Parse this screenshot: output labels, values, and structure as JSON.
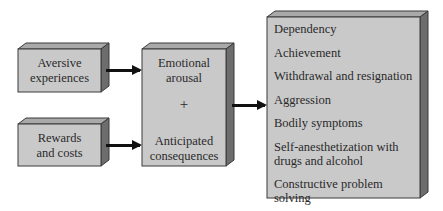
{
  "diagram": {
    "inputs": [
      {
        "label": "Aversive experiences",
        "line1": "Aversive",
        "line2": "experiences"
      },
      {
        "label": "Rewards and costs",
        "line1": "Rewards",
        "line2": "and costs"
      }
    ],
    "middle": {
      "top_line1": "Emotional",
      "top_line2": "arousal",
      "operator": "+",
      "bottom_line1": "Anticipated",
      "bottom_line2": "consequences"
    },
    "outcomes": [
      "Dependency",
      "Achievement",
      "Withdrawal and resignation",
      "Aggression",
      "Bodily symptoms",
      "Self-anesthetization with",
      "drugs and alcohol",
      "Constructive problem solving"
    ],
    "colors": {
      "box_front": "#c9c9c9",
      "box_top": "#a9a9a9",
      "box_side": "#6d6d6d",
      "arrow": "#111111"
    }
  }
}
